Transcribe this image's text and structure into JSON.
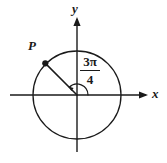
{
  "figure": {
    "type": "unit-circle-angle-diagram",
    "background_color": "#ffffff",
    "stroke_color": "#1a1a1a",
    "width": 167,
    "height": 163
  },
  "axes": {
    "x_label": "x",
    "y_label": "y",
    "origin": {
      "x": 77,
      "y": 95
    },
    "x_axis": {
      "start_x": 10,
      "end_x": 148,
      "y": 95,
      "arrow": "right"
    },
    "y_axis": {
      "x": 77,
      "start_y": 17,
      "end_y": 152,
      "arrow": "up"
    }
  },
  "circle": {
    "center_x": 77,
    "center_y": 95,
    "radius": 44
  },
  "point": {
    "label": "P",
    "x": 45,
    "y": 62,
    "angle_degrees": 135
  },
  "angle": {
    "numerator": "3π",
    "denominator": "4",
    "display": "3π/4",
    "degrees": 135,
    "arc_radius": 11,
    "direction": "counterclockwise"
  }
}
